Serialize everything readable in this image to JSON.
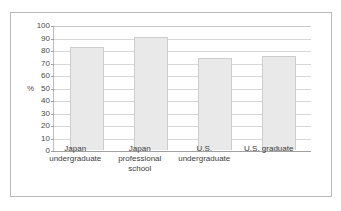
{
  "chart_data": {
    "type": "bar",
    "title": "",
    "subtitle": "",
    "xlabel": "",
    "ylabel": "%",
    "ylim": [
      0,
      100
    ],
    "ytick_step": 10,
    "yticks": [
      100,
      90,
      80,
      70,
      60,
      50,
      40,
      30,
      20,
      10,
      0
    ],
    "ytick_labels": [
      "100",
      "90",
      "80",
      "70",
      "60",
      "50",
      "40",
      "30",
      "20",
      "10",
      "0"
    ],
    "grid": true,
    "grid_orientation": "horizontal",
    "legend": false,
    "legend_position": "none",
    "categories": [
      "Japan\nundergraduate",
      "Japan professional\nschool",
      "U.S.\nundergraduate",
      "U.S. graduate"
    ],
    "values": [
      83,
      91,
      74,
      76
    ],
    "series": [
      {
        "name": "",
        "values": [
          83,
          91,
          74,
          76
        ]
      }
    ],
    "bar_fill_color": "#e9e9e9",
    "bar_border_color": "#cdcdcd",
    "gridline_color": "#d8d8d8",
    "axis_color": "#9f9f9f",
    "frame_border_color": "#b9b9b9",
    "background_color": "#ffffff",
    "text_color": "#3d3d3d",
    "annotations": []
  }
}
